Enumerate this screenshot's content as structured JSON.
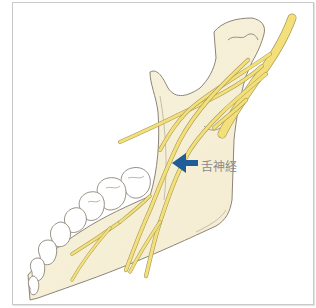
{
  "figure": {
    "type": "anatomical-illustration",
    "label": "舌神経",
    "arrow_color": "#1f5d99",
    "nerve_color": "#f4e07a",
    "bone_color": "#f6f0d6",
    "outline_color": "#8c8478"
  }
}
